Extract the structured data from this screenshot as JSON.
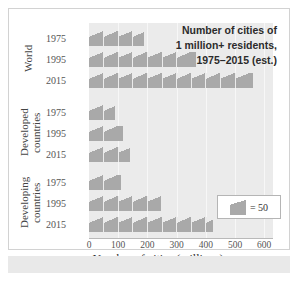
{
  "chart_data": {
    "type": "bar",
    "title": "Number of cities of 1 million+ residents, 1975–2015 (est.)",
    "title_lines": [
      "Number of cities of",
      "1 million+ residents,",
      "1975–2015 (est.)"
    ],
    "xlabel": "Number of cities (millions)",
    "ylabel": "",
    "xlim": [
      0,
      640
    ],
    "xticks": [
      0,
      100,
      200,
      300,
      400,
      500,
      600
    ],
    "xtick_labels": [
      "0",
      "100",
      "200",
      "300",
      "400",
      "500",
      "600"
    ],
    "grid": true,
    "legend": {
      "position": "inside-bottom-right",
      "icon": "pictograph-square",
      "text": "= 50",
      "unit_value": 50
    },
    "groups": [
      {
        "label": "World",
        "categories": [
          "1975",
          "1995",
          "2015"
        ],
        "values": [
          190,
          365,
          560
        ]
      },
      {
        "label": "Developed countries",
        "label_lines": [
          "Developed",
          "countries"
        ],
        "categories": [
          "1975",
          "1995",
          "2015"
        ],
        "values": [
          90,
          115,
          140
        ]
      },
      {
        "label": "Developing countries",
        "label_lines": [
          "Developing",
          "countries"
        ],
        "categories": [
          "1975",
          "1995",
          "2015"
        ],
        "values": [
          110,
          245,
          425
        ]
      }
    ],
    "series_color": "#a9a9a9",
    "plot_background": "#ebebeb"
  }
}
